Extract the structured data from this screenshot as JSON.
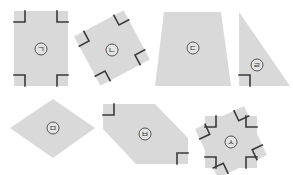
{
  "figure": {
    "background": "#ffffff",
    "shape_fill": "#d9d9d9",
    "mark_color": "#3a3a3a",
    "shapes": [
      {
        "id": "giyeok",
        "label": "ㄱ",
        "type": "rectangle",
        "right_angle_marks": 4
      },
      {
        "id": "nieun",
        "label": "ㄴ",
        "type": "square (rotated)",
        "right_angle_marks": 4
      },
      {
        "id": "digeut",
        "label": "ㄷ",
        "type": "trapezoid",
        "right_angle_marks": 0
      },
      {
        "id": "rieul",
        "label": "ㄹ",
        "type": "right triangle",
        "right_angle_marks": 1
      },
      {
        "id": "mieum",
        "label": "ㅁ",
        "type": "rhombus",
        "right_angle_marks": 0
      },
      {
        "id": "bieup",
        "label": "ㅂ",
        "type": "hexagon",
        "right_angle_marks": 2
      },
      {
        "id": "siot",
        "label": "ㅅ",
        "type": "octagon (star-like)",
        "right_angle_marks": 8
      }
    ]
  }
}
